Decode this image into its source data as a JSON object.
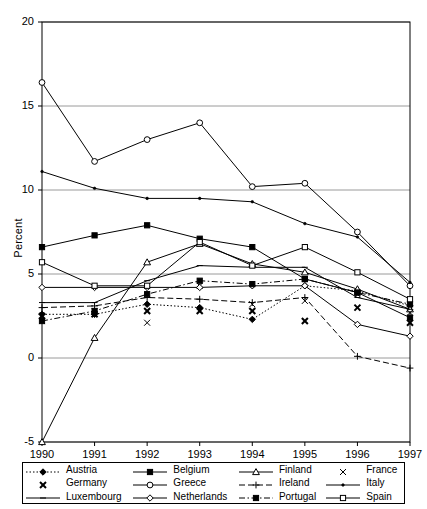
{
  "chart": {
    "type": "line",
    "title": "",
    "xlabel": "",
    "ylabel": "Percent",
    "ylim": [
      -5,
      20
    ],
    "xlim": [
      1990,
      1997
    ],
    "ytick_labels": [
      "20",
      "15",
      "10",
      "5",
      "0",
      "-5"
    ],
    "ytick_values": [
      20,
      15,
      10,
      5,
      0,
      -5
    ],
    "xtick_labels": [
      "1990",
      "1991",
      "1992",
      "1993",
      "1994",
      "1995",
      "1996",
      "1997"
    ],
    "grid": "horizontal",
    "legend_position": "below-axes"
  },
  "chart_data": {
    "type": "line",
    "title": "",
    "xlabel": "",
    "ylabel": "Percent",
    "ylim": [
      -5,
      20
    ],
    "grid": true,
    "legend_position": "bottom",
    "x": [
      1990,
      1991,
      1992,
      1993,
      1994,
      1995,
      1996,
      1997
    ],
    "series": [
      {
        "name": "Austria",
        "marker": "diamond-filled",
        "line": "dotted",
        "values": [
          2.6,
          2.6,
          3.2,
          3.0,
          2.3,
          4.3,
          4.0,
          3.1
        ]
      },
      {
        "name": "Belgium",
        "marker": "square-filled",
        "line": "solid",
        "values": [
          6.6,
          7.3,
          7.9,
          7.1,
          6.6,
          4.7,
          3.9,
          2.4
        ]
      },
      {
        "name": "Finland",
        "marker": "triangle-open",
        "line": "solid",
        "values": [
          -5.0,
          1.2,
          5.7,
          6.8,
          5.6,
          5.1,
          4.1,
          2.9
        ]
      },
      {
        "name": "France",
        "marker": "x",
        "line": "none",
        "values": [
          2.2,
          2.8,
          2.1,
          4.3,
          3.2,
          3.4,
          3.8,
          2.7
        ]
      },
      {
        "name": "Germany",
        "marker": "x-bold",
        "line": "none",
        "values": [
          2.5,
          2.6,
          2.8,
          2.8,
          2.8,
          2.2,
          3.0,
          2.1
        ]
      },
      {
        "name": "Greece",
        "marker": "circle-open",
        "line": "solid",
        "values": [
          16.4,
          11.7,
          13.0,
          14.0,
          10.2,
          10.4,
          7.5,
          4.3
        ]
      },
      {
        "name": "Ireland",
        "marker": "plus",
        "line": "dashed",
        "values": [
          3.0,
          3.1,
          3.6,
          3.5,
          3.3,
          3.6,
          0.1,
          -0.6
        ]
      },
      {
        "name": "Italy",
        "marker": "dot-small",
        "line": "solid",
        "values": [
          11.1,
          10.1,
          9.5,
          9.5,
          9.3,
          8.0,
          7.2,
          4.5
        ]
      },
      {
        "name": "Luxembourg",
        "marker": "line-flat",
        "line": "solid",
        "values": [
          3.3,
          3.3,
          4.6,
          5.5,
          5.4,
          5.4,
          3.6,
          2.9
        ]
      },
      {
        "name": "Netherlands",
        "marker": "diamond-open",
        "line": "solid",
        "values": [
          4.2,
          4.2,
          4.2,
          4.2,
          4.3,
          4.3,
          2.0,
          1.3
        ]
      },
      {
        "name": "Portugal",
        "marker": "square-filled",
        "line": "dash-dot",
        "values": [
          2.2,
          2.8,
          3.8,
          4.6,
          4.4,
          4.7,
          3.9,
          3.2
        ]
      },
      {
        "name": "Spain",
        "marker": "square-open",
        "line": "solid",
        "values": [
          5.7,
          4.3,
          4.3,
          6.9,
          5.5,
          6.6,
          5.1,
          3.5
        ]
      }
    ]
  },
  "legend": {
    "rows": [
      [
        {
          "label": "Austria",
          "key": "austria-key"
        },
        {
          "label": "Belgium",
          "key": "belgium-key"
        },
        {
          "label": "Finland",
          "key": "finland-key"
        },
        {
          "label": "France",
          "key": "france-key"
        }
      ],
      [
        {
          "label": "Germany",
          "key": "germany-key"
        },
        {
          "label": "Greece",
          "key": "greece-key"
        },
        {
          "label": "Ireland",
          "key": "ireland-key"
        },
        {
          "label": "Italy",
          "key": "italy-key"
        }
      ],
      [
        {
          "label": "Luxembourg",
          "key": "luxembourg-key"
        },
        {
          "label": "Netherlands",
          "key": "netherlands-key"
        },
        {
          "label": "Portugal",
          "key": "portugal-key"
        },
        {
          "label": "Spain",
          "key": "spain-key"
        }
      ]
    ]
  },
  "colors": {
    "line": "#000000",
    "grid": "#808080",
    "axis": "#000000",
    "background": "#ffffff"
  }
}
